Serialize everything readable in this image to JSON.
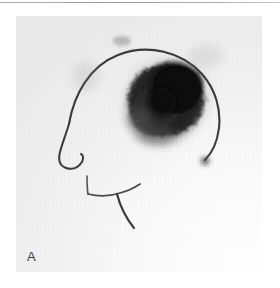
{
  "page": {
    "background_color": "#ffffff",
    "divider_color": "#a8a8a8"
  },
  "figure": {
    "panel_label": "A",
    "panel_background_color": "#ebebeb",
    "modality": "planar-scintigraphy-lateral-head",
    "ink_color": "#3a3a3a",
    "uptake_color": "#121212",
    "annotations": {
      "head_outline_label": "lateral-head-profile-outline",
      "uptake_label": "focal-tracer-uptake-parietal"
    }
  }
}
